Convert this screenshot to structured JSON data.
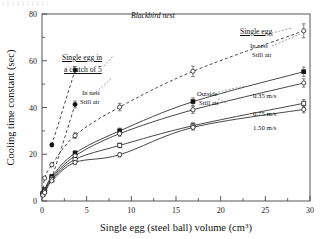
{
  "figure": {
    "panel_title": "Blackbird nest",
    "x_axis": {
      "label": "Single egg (steel ball) volume (cm",
      "label_sup": "3",
      "label_tail": ")",
      "ticks": [
        0,
        5,
        10,
        15,
        20,
        25,
        30
      ],
      "min": 0,
      "max": 30
    },
    "y_axis": {
      "label": "Cooling time constant (sec)",
      "ticks": [
        0,
        20,
        40,
        60,
        80
      ],
      "min": 0,
      "max": 80
    },
    "annotations": [
      {
        "id": "clutch-heading-l1",
        "text": "Single egg in",
        "x": 62,
        "y": 53
      },
      {
        "id": "clutch-heading-l2",
        "text": "a clutch of 5",
        "x": 64,
        "y": 65
      },
      {
        "id": "clutch-sub-l1",
        "text": "In nest",
        "x": 82,
        "y": 89
      },
      {
        "id": "clutch-sub-l2",
        "text": "Still air",
        "x": 80,
        "y": 98
      },
      {
        "id": "single-heading",
        "text": "Single egg",
        "x": 240,
        "y": 27
      },
      {
        "id": "single-sub-l1",
        "text": "In nest",
        "x": 250,
        "y": 42
      },
      {
        "id": "single-sub-l2",
        "text": "Still air",
        "x": 252,
        "y": 51
      },
      {
        "id": "outside-sub-l1",
        "text": "Outside",
        "x": 197,
        "y": 90
      },
      {
        "id": "outside-sub-l2",
        "text": "Still air",
        "x": 199,
        "y": 99
      },
      {
        "id": "speed-035",
        "text": "0.35 m/s",
        "x": 253,
        "y": 92
      },
      {
        "id": "speed-075",
        "text": "0.75 m/s",
        "x": 253,
        "y": 110
      },
      {
        "id": "speed-150",
        "text": "1.50 m/s",
        "x": 253,
        "y": 124
      }
    ],
    "colors": {
      "ink": "#111111",
      "axis": "#444444",
      "background": "#ffffff"
    }
  },
  "chart_data": {
    "type": "scatter",
    "title": "Blackbird nest",
    "xlabel": "Single egg (steel ball) volume (cm3)",
    "ylabel": "Cooling time constant (sec)",
    "xlim": [
      0,
      30
    ],
    "ylim": [
      0,
      80
    ],
    "grid": false,
    "legend": "inline annotations",
    "series": [
      {
        "name": "Single egg in a clutch of 5 - In nest, Still air",
        "marker": "filled-circle",
        "line": "dashed",
        "x": [
          0.1,
          0.3,
          1.1,
          3.7
        ],
        "y": [
          3.5,
          4.5,
          10.0,
          41.3
        ],
        "yerr": [
          0.5,
          0.5,
          0.8,
          1.5
        ]
      },
      {
        "name": "Single egg in a clutch of 5 - In nest, Still air (upper)",
        "marker": "filled-circle",
        "line": "dashed",
        "x": [
          1.1,
          3.7
        ],
        "y": [
          24.0,
          56.0
        ],
        "yerr": [
          0.8,
          1.5
        ]
      },
      {
        "name": "Single egg - In nest, Still air",
        "marker": "open-circle",
        "line": "dashed",
        "x": [
          0.1,
          0.3,
          1.1,
          3.7,
          8.7,
          16.9,
          29.3
        ],
        "y": [
          3.0,
          9.8,
          15.5,
          28.0,
          40.2,
          55.5,
          72.8
        ],
        "yerr": [
          0.5,
          0.6,
          0.8,
          1.2,
          1.6,
          2.2,
          3.0
        ]
      },
      {
        "name": "Outside, Still air",
        "marker": "filled-square",
        "line": "solid",
        "x": [
          0.1,
          0.3,
          1.1,
          3.7,
          8.7,
          16.9,
          29.3
        ],
        "y": [
          3.2,
          4.8,
          10.5,
          20.5,
          30.0,
          42.5,
          55.3
        ],
        "yerr": [
          0.4,
          0.5,
          0.7,
          1.0,
          1.2,
          1.6,
          2.0
        ]
      },
      {
        "name": "0.35 m/s",
        "marker": "open-circle",
        "line": "solid",
        "x": [
          0.1,
          0.3,
          1.1,
          3.7,
          8.7,
          16.9,
          29.3
        ],
        "y": [
          3.0,
          4.4,
          9.8,
          19.3,
          28.8,
          39.0,
          50.5
        ],
        "yerr": [
          0.4,
          0.4,
          0.6,
          0.9,
          1.1,
          1.5,
          1.8
        ]
      },
      {
        "name": "0.75 m/s",
        "marker": "open-square",
        "line": "solid",
        "x": [
          0.1,
          0.3,
          1.1,
          3.7,
          8.7,
          16.9,
          29.3
        ],
        "y": [
          2.8,
          4.0,
          9.2,
          17.8,
          23.8,
          32.2,
          41.8
        ],
        "yerr": [
          0.4,
          0.4,
          0.6,
          0.8,
          1.0,
          1.3,
          1.6
        ]
      },
      {
        "name": "1.50 m/s",
        "marker": "open-circle",
        "line": "solid",
        "x": [
          0.1,
          0.3,
          1.1,
          3.7,
          8.7,
          16.9,
          29.3
        ],
        "y": [
          2.5,
          3.6,
          8.6,
          16.5,
          19.8,
          31.5,
          39.2
        ],
        "yerr": [
          0.3,
          0.4,
          0.5,
          0.8,
          0.9,
          1.2,
          1.5
        ]
      }
    ]
  }
}
